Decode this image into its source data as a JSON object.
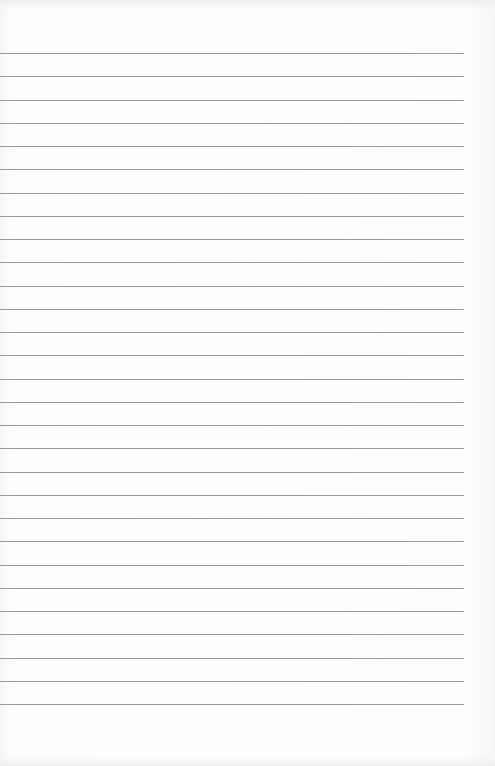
{
  "page": {
    "type": "lined-paper",
    "line_count": 29,
    "first_line_y": 53,
    "line_spacing": 23.25,
    "line_width": 464,
    "line_color": "#9a9a9a",
    "background_color": "#fcfcfc"
  }
}
